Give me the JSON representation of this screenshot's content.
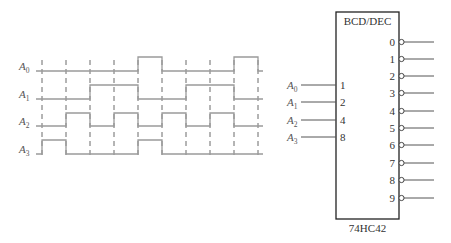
{
  "timing_diagram": {
    "signals": [
      {
        "name": "A",
        "sub": "0",
        "label_y": 70,
        "low_y": 71,
        "high_y": 57
      },
      {
        "name": "A",
        "sub": "1",
        "label_y": 98,
        "low_y": 99,
        "high_y": 85
      },
      {
        "name": "A",
        "sub": "2",
        "label_y": 125,
        "low_y": 126,
        "high_y": 113
      },
      {
        "name": "A",
        "sub": "3",
        "label_y": 153,
        "low_y": 154,
        "high_y": 140
      }
    ],
    "x_start": 36,
    "x_end": 263,
    "boundaries": [
      42,
      66,
      90,
      114,
      138,
      162,
      186,
      210,
      234,
      258
    ],
    "bcd_sequence": [
      0,
      8,
      4,
      2,
      6,
      9,
      4,
      2,
      6,
      1,
      0
    ]
  },
  "decoder": {
    "title": "BCD/DEC",
    "part_number": "74HC42",
    "inputs": [
      {
        "name": "A",
        "sub": "0",
        "pin": "1",
        "y": 85
      },
      {
        "name": "A",
        "sub": "1",
        "pin": "2",
        "y": 102
      },
      {
        "name": "A",
        "sub": "2",
        "pin": "4",
        "y": 120
      },
      {
        "name": "A",
        "sub": "3",
        "pin": "8",
        "y": 137
      }
    ],
    "outputs": [
      {
        "pin": "0",
        "y": 42
      },
      {
        "pin": "1",
        "y": 59
      },
      {
        "pin": "2",
        "y": 76
      },
      {
        "pin": "3",
        "y": 93
      },
      {
        "pin": "4",
        "y": 111
      },
      {
        "pin": "5",
        "y": 128
      },
      {
        "pin": "6",
        "y": 145
      },
      {
        "pin": "7",
        "y": 163
      },
      {
        "pin": "8",
        "y": 180
      },
      {
        "pin": "9",
        "y": 198
      }
    ],
    "output_type": "active-low"
  }
}
